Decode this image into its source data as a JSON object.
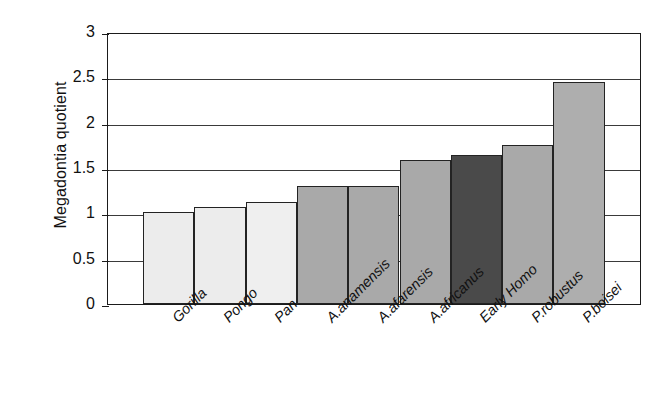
{
  "chart_data": {
    "type": "bar",
    "title": "",
    "xlabel": "",
    "ylabel": "Megadontia quotient",
    "ylim": [
      0,
      3
    ],
    "yticks": [
      "0",
      "0.5",
      "1",
      "1.5",
      "2",
      "2.5",
      "3"
    ],
    "ytick_values": [
      0,
      0.5,
      1,
      1.5,
      2,
      2.5,
      3
    ],
    "grid": true,
    "legend": "none",
    "categories": [
      "Gorilla",
      "Pongo",
      "Pan",
      "A.anamensis",
      "A.afarensis",
      "A.africanus",
      "Early Homo",
      "P.robustus",
      "P.boisei"
    ],
    "values": [
      1.01,
      1.07,
      1.13,
      1.3,
      1.3,
      1.59,
      1.64,
      1.75,
      2.45
    ],
    "bar_colors": [
      "#ececec",
      "#ececec",
      "#efefef",
      "#a9a9a9",
      "#a9a9a9",
      "#a9a9a9",
      "#4a4a4a",
      "#a9a9a9",
      "#aeaeae"
    ],
    "bar_border_color": "#232323",
    "axis_color": "#1b1b1b",
    "grid_color": "#3a3a3a",
    "background": "#ffffff"
  }
}
